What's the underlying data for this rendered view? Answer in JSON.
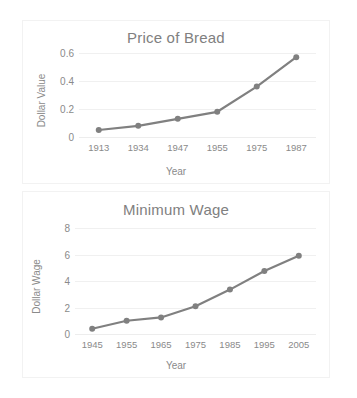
{
  "page": {
    "background": "#ffffff",
    "series_color": "#808080",
    "text_color": "#8a8a8a",
    "grid_color": "#f0f0f0",
    "panel_border_color": "#f2f2f2"
  },
  "chart_data": [
    {
      "type": "line",
      "title": "Price of Bread",
      "xlabel": "Year",
      "ylabel": "Dollar Value",
      "categories": [
        "1913",
        "1934",
        "1947",
        "1955",
        "1975",
        "1987"
      ],
      "values": [
        0.05,
        0.08,
        0.13,
        0.18,
        0.36,
        0.57
      ],
      "yticks": [
        "0",
        "0.2",
        "0.4",
        "0.6"
      ],
      "ytick_values": [
        0,
        0.2,
        0.4,
        0.6
      ],
      "ylim": [
        0,
        0.6
      ],
      "grid": true,
      "legend": false,
      "markers": true,
      "series_color": "#808080"
    },
    {
      "type": "line",
      "title": "Minimum Wage",
      "xlabel": "Year",
      "ylabel": "Dollar Wage",
      "categories": [
        "1945",
        "1955",
        "1965",
        "1975",
        "1985",
        "1995",
        "2005"
      ],
      "values": [
        0.4,
        1.0,
        1.25,
        2.1,
        3.35,
        4.75,
        5.9
      ],
      "yticks": [
        "0",
        "2",
        "4",
        "6",
        "8"
      ],
      "ytick_values": [
        0,
        2,
        4,
        6,
        8
      ],
      "ylim": [
        0,
        8
      ],
      "grid": true,
      "legend": false,
      "markers": true,
      "series_color": "#808080"
    }
  ]
}
